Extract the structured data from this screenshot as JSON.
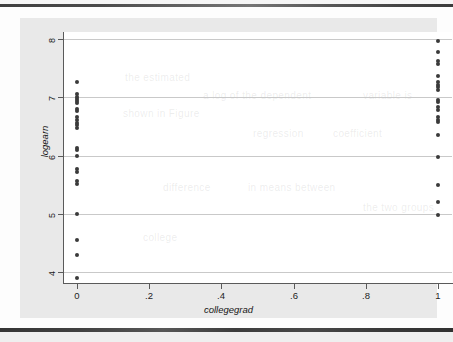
{
  "figure": {
    "kind": "stata-scatter-plot",
    "background_color": "#e9e9e9",
    "plot_background_color": "#ffffff",
    "marker_color": "#3a3a3a",
    "grid_color": "#c9c9c9",
    "axis_color": "#5a5a5a"
  },
  "chart_data": {
    "type": "scatter",
    "title": "",
    "xlabel": "collegegrad",
    "ylabel": "logearn",
    "xlim": [
      -0.04,
      1.04
    ],
    "ylim": [
      3.82,
      8.12
    ],
    "xticks": [
      0,
      0.2,
      0.4,
      0.6,
      0.8,
      1
    ],
    "xticklabels": [
      "0",
      ".2",
      ".4",
      ".6",
      ".8",
      "1"
    ],
    "yticks": [
      4,
      5,
      6,
      7,
      8
    ],
    "yticklabels": [
      "4",
      "5",
      "6",
      "7",
      "8"
    ],
    "grid": "horizontal",
    "legend": "none",
    "series": [
      {
        "name": "logearn vs collegegrad",
        "points": [
          {
            "x": 0,
            "y": 7.26
          },
          {
            "x": 0,
            "y": 7.05
          },
          {
            "x": 0,
            "y": 7.01
          },
          {
            "x": 0,
            "y": 6.97
          },
          {
            "x": 0,
            "y": 6.93
          },
          {
            "x": 0,
            "y": 6.9
          },
          {
            "x": 0,
            "y": 6.8
          },
          {
            "x": 0,
            "y": 6.76
          },
          {
            "x": 0,
            "y": 6.66
          },
          {
            "x": 0,
            "y": 6.62
          },
          {
            "x": 0,
            "y": 6.56
          },
          {
            "x": 0,
            "y": 6.52
          },
          {
            "x": 0,
            "y": 6.48
          },
          {
            "x": 0,
            "y": 6.14
          },
          {
            "x": 0,
            "y": 6.1
          },
          {
            "x": 0,
            "y": 5.99
          },
          {
            "x": 0,
            "y": 5.77
          },
          {
            "x": 0,
            "y": 5.73
          },
          {
            "x": 0,
            "y": 5.56
          },
          {
            "x": 0,
            "y": 5.52
          },
          {
            "x": 0,
            "y": 5.0
          },
          {
            "x": 0,
            "y": 4.56
          },
          {
            "x": 0,
            "y": 4.3
          },
          {
            "x": 0,
            "y": 3.9
          },
          {
            "x": 1,
            "y": 7.96
          },
          {
            "x": 1,
            "y": 7.77
          },
          {
            "x": 1,
            "y": 7.62
          },
          {
            "x": 1,
            "y": 7.58
          },
          {
            "x": 1,
            "y": 7.36
          },
          {
            "x": 1,
            "y": 7.26
          },
          {
            "x": 1,
            "y": 7.22
          },
          {
            "x": 1,
            "y": 7.18
          },
          {
            "x": 1,
            "y": 7.13
          },
          {
            "x": 1,
            "y": 6.96
          },
          {
            "x": 1,
            "y": 6.92
          },
          {
            "x": 1,
            "y": 6.84
          },
          {
            "x": 1,
            "y": 6.79
          },
          {
            "x": 1,
            "y": 6.66
          },
          {
            "x": 1,
            "y": 6.62
          },
          {
            "x": 1,
            "y": 6.57
          },
          {
            "x": 1,
            "y": 6.35
          },
          {
            "x": 1,
            "y": 5.98
          },
          {
            "x": 1,
            "y": 5.5
          },
          {
            "x": 1,
            "y": 5.2
          },
          {
            "x": 1,
            "y": 4.99
          }
        ]
      }
    ]
  },
  "ghost_text": [
    {
      "text": "the estimated",
      "x": 62,
      "y": 40
    },
    {
      "text": "a log of the dependent",
      "x": 140,
      "y": 58
    },
    {
      "text": "variable is",
      "x": 300,
      "y": 58
    },
    {
      "text": "shown in Figure",
      "x": 60,
      "y": 76
    },
    {
      "text": "regression",
      "x": 190,
      "y": 96
    },
    {
      "text": "coefficient",
      "x": 270,
      "y": 96
    },
    {
      "text": "difference",
      "x": 100,
      "y": 150
    },
    {
      "text": "in means between",
      "x": 185,
      "y": 150
    },
    {
      "text": "the two groups",
      "x": 300,
      "y": 170
    },
    {
      "text": "college",
      "x": 80,
      "y": 200
    }
  ]
}
